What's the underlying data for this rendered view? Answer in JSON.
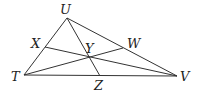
{
  "diagram": {
    "type": "triangle-with-cevians",
    "points": {
      "U": {
        "label": "U",
        "x": 67,
        "y": 18,
        "lx": 60,
        "ly": 14
      },
      "T": {
        "label": "T",
        "x": 24,
        "y": 75,
        "lx": 11,
        "ly": 81
      },
      "V": {
        "label": "V",
        "x": 177,
        "y": 76,
        "lx": 180,
        "ly": 81
      },
      "X": {
        "label": "X",
        "x": 45,
        "y": 47,
        "lx": 31,
        "ly": 48
      },
      "W": {
        "label": "W",
        "x": 123,
        "y": 48,
        "lx": 127,
        "ly": 48
      },
      "Y": {
        "label": "Y",
        "x": 90,
        "y": 57,
        "lx": 85,
        "ly": 53
      },
      "Z": {
        "label": "Z",
        "x": 100,
        "y": 76,
        "lx": 94,
        "ly": 90
      }
    },
    "segments": [
      [
        "T",
        "U"
      ],
      [
        "U",
        "V"
      ],
      [
        "T",
        "V"
      ],
      [
        "U",
        "Z"
      ],
      [
        "X",
        "V"
      ],
      [
        "T",
        "W"
      ]
    ]
  }
}
